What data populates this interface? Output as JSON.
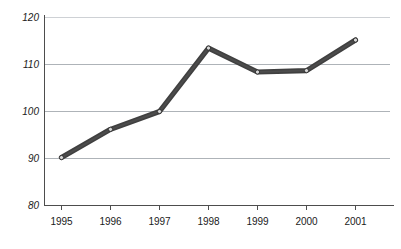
{
  "chart_data": {
    "type": "line",
    "title": "",
    "subtitle": "",
    "xlabel": "",
    "ylabel": "",
    "categories": [
      "1995",
      "1996",
      "1997",
      "1998",
      "1999",
      "2000",
      "2001"
    ],
    "values": [
      90.2,
      96.2,
      100.0,
      113.5,
      108.4,
      108.7,
      115.2
    ],
    "series": [
      {
        "name": "Index",
        "values": [
          90.2,
          96.2,
          100.0,
          113.5,
          108.4,
          108.7,
          115.2
        ]
      }
    ],
    "ylim": [
      80,
      120
    ],
    "yticks": [
      80,
      90,
      100,
      110,
      120
    ],
    "ytick_labels": [
      "80",
      "90",
      "100",
      "110",
      "120"
    ],
    "xtick_labels": [
      "1995",
      "1996",
      "1997",
      "1998",
      "1999",
      "2000",
      "2001"
    ],
    "grid": true,
    "grid_axis": "y",
    "legend": false,
    "legend_position": "none",
    "annotations": [],
    "colors": {
      "line": "#404040",
      "marker_fill": "#d8d8d8",
      "marker_edge": "#2b2b2b",
      "gridline": "#9aa0a6",
      "gridline_top": "#c2c6ca",
      "axis": "#4d4d4d",
      "background": "#ffffff",
      "tick_text": "#1a1a1a"
    },
    "marker_style": "circle",
    "line_width": 5.2
  },
  "axes": {
    "y": {
      "ticks": [
        {
          "label": "120",
          "value": 120
        },
        {
          "label": "110",
          "value": 110
        },
        {
          "label": "100",
          "value": 100
        },
        {
          "label": "90",
          "value": 90
        },
        {
          "label": "80",
          "value": 80
        }
      ]
    },
    "x": {
      "ticks": [
        {
          "label": "1995"
        },
        {
          "label": "1996"
        },
        {
          "label": "1997"
        },
        {
          "label": "1998"
        },
        {
          "label": "1999"
        },
        {
          "label": "2000"
        },
        {
          "label": "2001"
        }
      ]
    }
  }
}
